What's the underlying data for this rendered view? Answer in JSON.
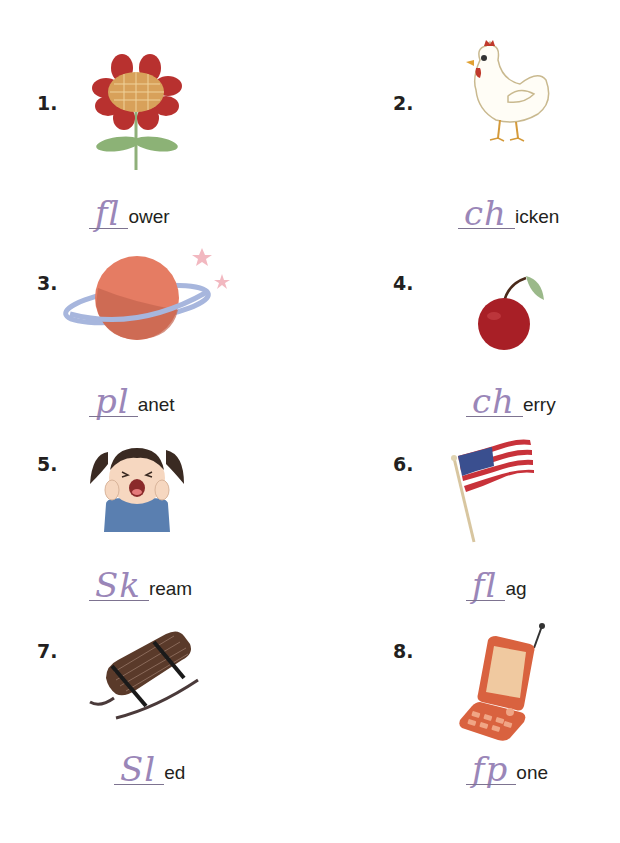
{
  "worksheet": {
    "items": [
      {
        "number": "1.",
        "picture": "flower",
        "written": "fl",
        "printed": "ower"
      },
      {
        "number": "2.",
        "picture": "chicken",
        "written": "ch",
        "printed": "icken"
      },
      {
        "number": "3.",
        "picture": "planet",
        "written": "pl",
        "printed": "anet"
      },
      {
        "number": "4.",
        "picture": "cherry",
        "written": "ch",
        "printed": "erry"
      },
      {
        "number": "5.",
        "picture": "screaming-girl",
        "written": "Sk",
        "printed": "ream"
      },
      {
        "number": "6.",
        "picture": "american-flag",
        "written": "fl",
        "printed": "ag"
      },
      {
        "number": "7.",
        "picture": "sled",
        "written": "Sl",
        "printed": "ed"
      },
      {
        "number": "8.",
        "picture": "flip-phone",
        "written": "fp",
        "printed": "one"
      }
    ]
  },
  "colors": {
    "handwriting": "#9a86b8",
    "text": "#231f20",
    "flower_petal": "#c0392b",
    "leaf": "#7aa56a",
    "planet": "#e8826a",
    "ring": "#9fb0d8",
    "cherry": "#b3202a",
    "flag_red": "#c8323a",
    "flag_blue": "#3a4f8f",
    "sled": "#5a3a2a",
    "phone": "#d9623f"
  }
}
